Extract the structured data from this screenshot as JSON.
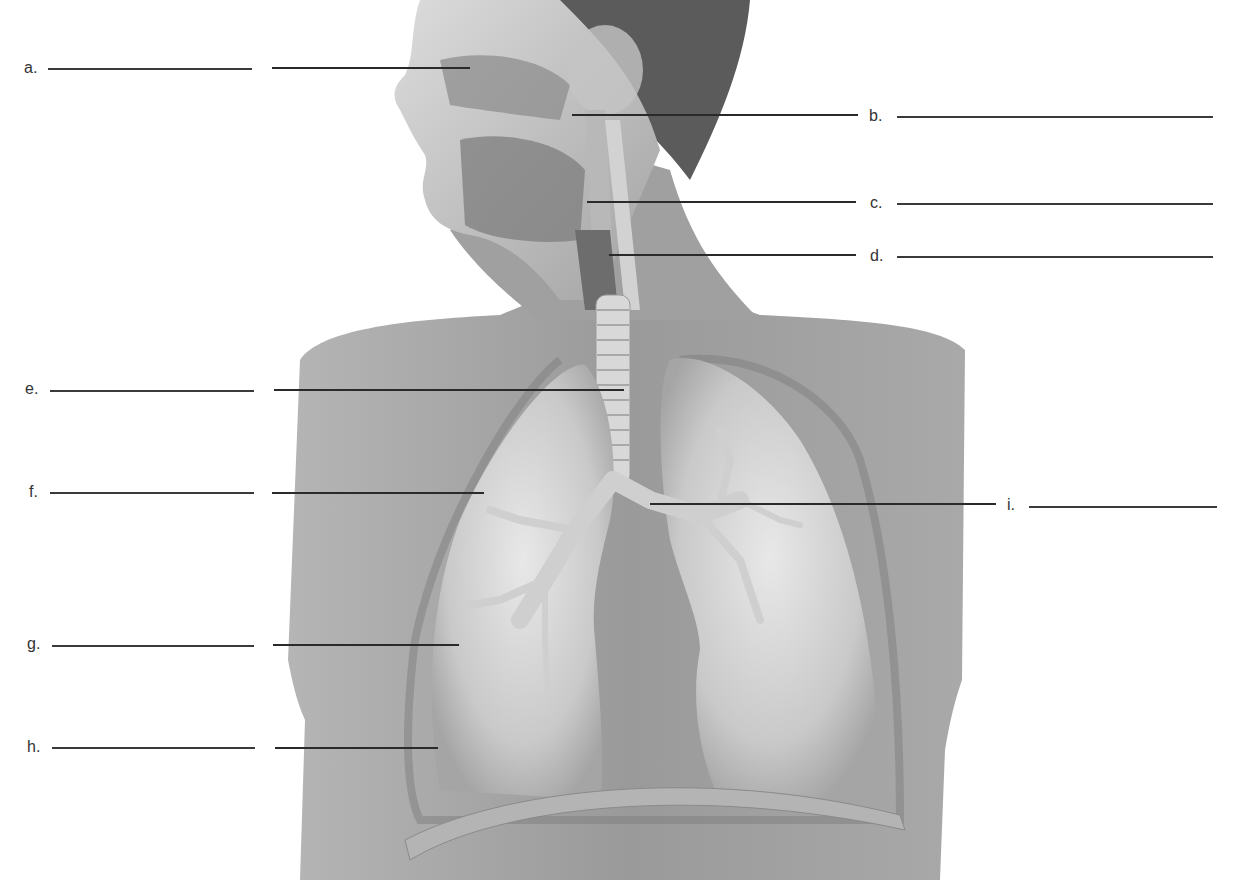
{
  "diagram": {
    "colors": {
      "background": "#ffffff",
      "skin_light": "#d9d9d9",
      "skin_mid": "#a8a8a8",
      "skin_dark": "#7a7a7a",
      "hair": "#4a4a4a",
      "lung": "#c8c8c8",
      "lung_highlight": "#e6e6e6",
      "line": "#2a2a2a"
    },
    "labels": [
      {
        "id": "a",
        "text": "a.",
        "side": "left",
        "y": 68,
        "blank_x": [
          48,
          252
        ],
        "leader_x": [
          272,
          470
        ]
      },
      {
        "id": "b",
        "text": "b.",
        "side": "right",
        "y": 116,
        "blank_x": [
          897,
          1213
        ],
        "leader_x": [
          572,
          858
        ]
      },
      {
        "id": "c",
        "text": "c.",
        "side": "right",
        "y": 203,
        "blank_x": [
          897,
          1213
        ],
        "leader_x": [
          587,
          856
        ]
      },
      {
        "id": "d",
        "text": "d.",
        "side": "right",
        "y": 256,
        "blank_x": [
          897,
          1213
        ],
        "leader_x": [
          609,
          856
        ]
      },
      {
        "id": "e",
        "text": "e.",
        "side": "left",
        "y": 390,
        "blank_x": [
          50,
          254
        ],
        "leader_x": [
          274,
          624
        ]
      },
      {
        "id": "f",
        "text": "f.",
        "side": "left",
        "y": 492,
        "blank_x": [
          50,
          254
        ],
        "leader_x": [
          272,
          484
        ]
      },
      {
        "id": "g",
        "text": "g.",
        "side": "left",
        "y": 645,
        "blank_x": [
          52,
          254
        ],
        "leader_x": [
          273,
          459
        ]
      },
      {
        "id": "h",
        "text": "h.",
        "side": "left",
        "y": 747,
        "blank_x": [
          52,
          255
        ],
        "leader_x": [
          275,
          438
        ]
      },
      {
        "id": "i",
        "text": "i.",
        "side": "right",
        "y": 505,
        "blank_x": [
          1029,
          1217
        ],
        "leader_x": [
          650,
          996
        ]
      }
    ]
  }
}
